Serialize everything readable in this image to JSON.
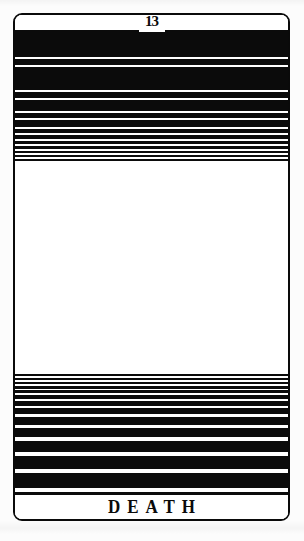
{
  "scan": {
    "media": "tarot-card",
    "page_background": "#fcfcfc",
    "ink_color": "#0b0b0b",
    "paper_color": "#ffffff"
  },
  "card": {
    "numeral": "13",
    "title": "DEATH",
    "border_color": "#0a0a0a"
  },
  "chart_data": {
    "type": "bar",
    "title": "DEATH",
    "subtitle": "13",
    "xlabel": "",
    "ylabel": "",
    "grid": false,
    "legend": null,
    "upper_band": {
      "label": "upper ink bands",
      "tops": [
        15,
        44,
        52,
        77,
        85,
        98,
        105,
        114,
        120,
        126,
        131,
        136,
        140,
        144
      ],
      "thicknesses": [
        27,
        6,
        23,
        6,
        11,
        5,
        7,
        4,
        4,
        3,
        3,
        2,
        2,
        2
      ]
    },
    "lower_band": {
      "label": "lower ink bands",
      "tops": [
        359,
        363,
        367,
        371,
        375,
        380,
        386,
        393,
        402,
        413,
        426,
        441,
        458,
        477
      ],
      "thicknesses": [
        2,
        2,
        2,
        3,
        3,
        4,
        5,
        6,
        8,
        9,
        11,
        13,
        15,
        17
      ]
    },
    "central_field": {
      "label": "blank field",
      "top": 146,
      "height": 213
    }
  }
}
